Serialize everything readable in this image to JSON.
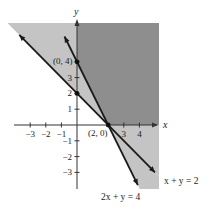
{
  "chart_data": {
    "type": "line",
    "title": "",
    "xlabel": "x",
    "ylabel": "y",
    "xlim": [
      -3.8,
      5.0
    ],
    "ylim": [
      -3.8,
      5.5
    ],
    "grid": false,
    "x_ticks": [
      -3,
      -2,
      -1,
      3,
      4
    ],
    "x_tick_labels": [
      "−3",
      "−2",
      "−1",
      "3",
      "4"
    ],
    "y_ticks": [
      4,
      3,
      2,
      1,
      -1,
      -2,
      -3
    ],
    "y_tick_labels": [
      "",
      "3",
      "2",
      "1",
      "−1",
      "−2",
      "−3"
    ],
    "series": [
      {
        "name": "x + y = 2",
        "slope": -1,
        "intercept": 2,
        "x_range": [
          -3.7,
          5.0
        ]
      },
      {
        "name": "2x + y = 4",
        "slope": -2,
        "intercept": 4,
        "x_range": [
          -0.8,
          3.9
        ]
      }
    ],
    "points": [
      {
        "label": "(0, 4)",
        "x": 0,
        "y": 4
      },
      {
        "label": "",
        "x": 0,
        "y": 2
      },
      {
        "label": "(2, 0)",
        "x": 2,
        "y": 0
      }
    ],
    "regions": [
      {
        "name": "light-shaded",
        "description": "x + y ≥ 2 within window",
        "color": "#c4c4c4"
      },
      {
        "name": "dark-shaded",
        "description": "x ≥ 0, y ≥ 0, 2x + y ≥ 4",
        "color": "#8e8e8e"
      }
    ],
    "annotations": [
      "(0, 4)",
      "(2, 0)",
      "x + y = 2",
      "2x + y = 4"
    ]
  },
  "labels": {
    "x_axis": "x",
    "y_axis": "y",
    "line1": "x + y = 2",
    "line2": "2x + y = 4",
    "point_0_4": "(0, 4)",
    "point_2_0": "(2, 0)"
  },
  "colors": {
    "light_region": "#c4c4c4",
    "dark_region": "#8e8e8e",
    "line": "#1a1a1a"
  }
}
